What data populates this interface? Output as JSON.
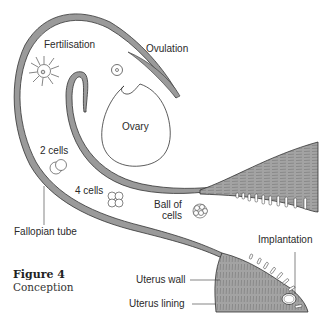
{
  "figure": {
    "number": "Figure 4",
    "caption": "Conception"
  },
  "labels": {
    "fertilisation": "Fertilisation",
    "ovulation": "Ovulation",
    "ovary": "Ovary",
    "two_cells": "2 cells",
    "four_cells": "4 cells",
    "ball_of_cells_line1": "Ball of",
    "ball_of_cells_line2": "cells",
    "fallopian_tube": "Fallopian tube",
    "implantation": "Implantation",
    "uterus_wall": "Uterus wall",
    "uterus_lining": "Uterus lining"
  },
  "colors": {
    "tissue_fill": "#9a9a9a",
    "outline": "#333333",
    "background": "#ffffff"
  }
}
